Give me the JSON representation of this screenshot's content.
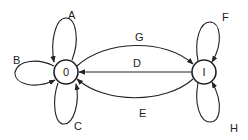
{
  "diagram": {
    "type": "state-transition",
    "colors": {
      "stroke": "#222222",
      "background": "#ffffff"
    },
    "nodes": [
      {
        "id": "0",
        "label": "0",
        "cx": 66,
        "cy": 72,
        "r": 12
      },
      {
        "id": "I",
        "label": "I",
        "cx": 204,
        "cy": 72,
        "r": 12
      }
    ],
    "edges": [
      {
        "label": "A",
        "from": "0",
        "to": "0",
        "kind": "self-loop-top"
      },
      {
        "label": "B",
        "from": "0",
        "to": "0",
        "kind": "self-loop-left"
      },
      {
        "label": "C",
        "from": "0",
        "to": "0",
        "kind": "self-loop-bottom"
      },
      {
        "label": "G",
        "from": "0",
        "to": "I",
        "kind": "arc-upper"
      },
      {
        "label": "D",
        "from": "I",
        "to": "0",
        "kind": "straight"
      },
      {
        "label": "E",
        "from": "I",
        "to": "0",
        "kind": "arc-lower"
      },
      {
        "label": "F",
        "from": "I",
        "to": "I",
        "kind": "self-loop-top"
      },
      {
        "label": "H",
        "from": "I",
        "to": "I",
        "kind": "self-loop-bottom"
      }
    ]
  }
}
